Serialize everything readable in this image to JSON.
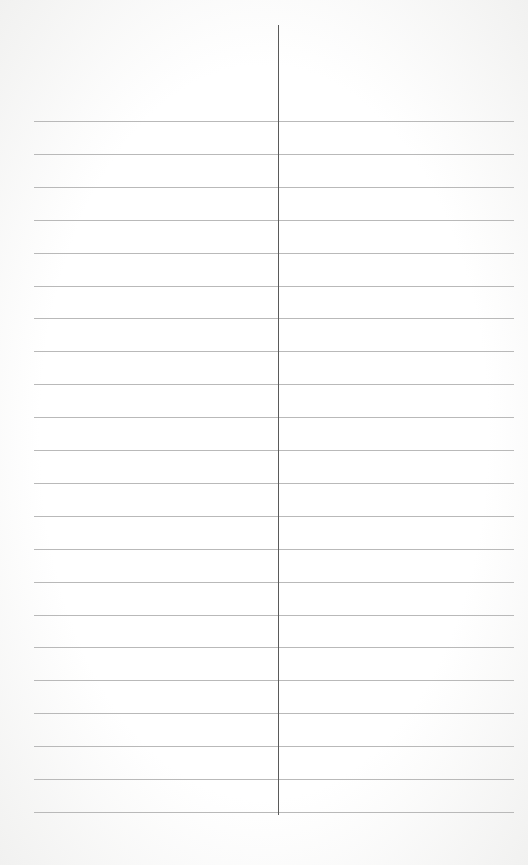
{
  "page": {
    "type": "blank two-column lined sheet",
    "rule_count": 22,
    "first_rule_y": 121,
    "rule_spacing_px": 32.9,
    "rule_color": "#b9b9b9",
    "divider_color": "#5a5a5a",
    "paper_color": "#ffffff",
    "columns": [
      {
        "name": "left",
        "text": ""
      },
      {
        "name": "right",
        "text": ""
      }
    ]
  }
}
